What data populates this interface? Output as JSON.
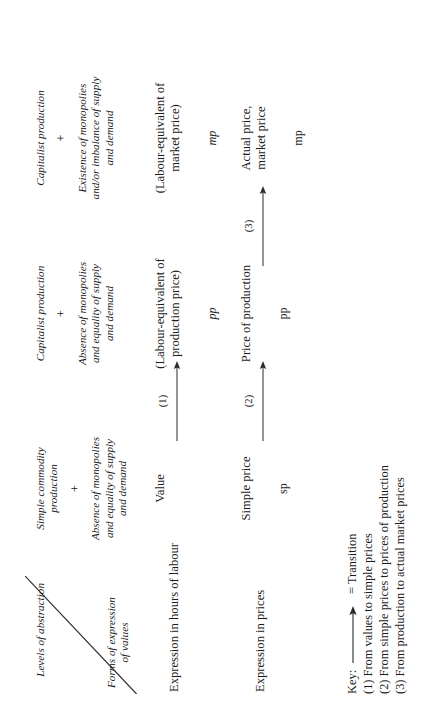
{
  "table": {
    "corner": {
      "levels_label": "Levels of abstraction",
      "forms_label_line1": "Forms of expression",
      "forms_label_line2": "of values"
    },
    "columns": [
      {
        "level": "Simple commodity\nproduction",
        "plus": "+",
        "condition": "Absence of monopolies\nand equality of supply\nand demand"
      },
      {
        "level": "Capitalist production",
        "plus": "+",
        "condition": "Absence of monopolies\nand equality of supply\nand demand"
      },
      {
        "level": "Capitalist production",
        "plus": "+",
        "condition": "Existence of monopolies\nand/or imbalance of supply\nand demand"
      }
    ],
    "rows": [
      {
        "stub": "Expression in hours of labour",
        "cells": [
          {
            "text": "Value",
            "code": ""
          },
          {
            "text": "(Labour-equivalent of\nproduction price)",
            "code": "pp"
          },
          {
            "text": "(Labour-equivalent of\nmarket price)",
            "code": "mp"
          }
        ],
        "transitions": [
          {
            "number": "(1)"
          }
        ]
      },
      {
        "stub": "Expression in prices",
        "cells": [
          {
            "text": "Simple price",
            "code": "sp"
          },
          {
            "text": "Price of production",
            "code": "pp"
          },
          {
            "text": "Actual price,\nmarket price",
            "code": "mp"
          }
        ],
        "transitions": [
          {
            "number": "(2)"
          },
          {
            "number": "(3)"
          }
        ]
      }
    ]
  },
  "key": {
    "label": "Key:",
    "arrow_icon": "right-arrow",
    "legend": "= Transition",
    "items": [
      "(1) From values to simple prices",
      "(2) From simple prices to prices of production",
      "(3) From production to actual market prices"
    ]
  }
}
